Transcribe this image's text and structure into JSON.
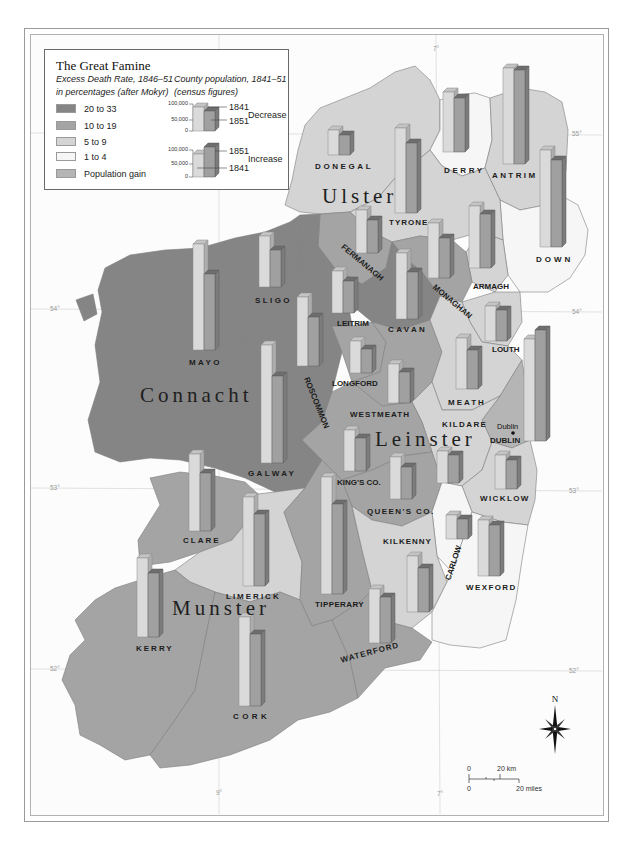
{
  "title": "The Great Famine",
  "legend": {
    "death_rate_heading": "Excess Death Rate, 1846–51",
    "death_rate_subheading": "in percentages (after Mokyr)",
    "population_heading": "County population, 1841–51",
    "population_subheading": "(census figures)",
    "categories": [
      {
        "id": "c20",
        "label": "20 to 33",
        "color": "#858585"
      },
      {
        "id": "c10",
        "label": "10 to 19",
        "color": "#a4a4a4"
      },
      {
        "id": "c5",
        "label": "5 to 9",
        "color": "#d4d4d4"
      },
      {
        "id": "c1",
        "label": "1 to 4",
        "color": "#f6f6f6"
      },
      {
        "id": "gain",
        "label": "Population gain",
        "color": "#b5b5b5"
      }
    ],
    "decrease_example": {
      "tick_100k": "100,000",
      "tick_50k": "50,000",
      "tick_0": "0",
      "label_upper": "1841",
      "label_lower": "1851",
      "trend": "Decrease"
    },
    "increase_example": {
      "tick_100k": "100,000",
      "tick_50k": "50,000",
      "tick_0": "0",
      "label_upper": "1851",
      "label_lower": "1841",
      "trend": "Increase"
    }
  },
  "bar_colors": {
    "y1841": {
      "front": "#dadada",
      "top": "#c4c4c4",
      "side": "#adadad",
      "stroke": "#8a8a8a"
    },
    "y1851": {
      "front": "#a0a0a0",
      "top": "#6e6e6e",
      "side": "#7c7c7c",
      "stroke": "#5e5e5e"
    }
  },
  "provinces": [
    {
      "name": "Ulster"
    },
    {
      "name": "Connacht"
    },
    {
      "name": "Leinster"
    },
    {
      "name": "Munster"
    }
  ],
  "graticule": {
    "lat55": "55°",
    "lat54": "54°",
    "lat53": "53°",
    "lat52": "52°",
    "lon7": "7°",
    "lon9": "9°"
  },
  "city": {
    "name": "Dublin"
  },
  "compass": {
    "north_label": "N"
  },
  "scale": {
    "km_zero": "0",
    "km_label": "20 km",
    "mi_zero": "0",
    "mi_label": "20 miles"
  },
  "counties": [
    {
      "id": "donegal",
      "name": "DONEGAL",
      "province": "Ulster",
      "category": "c5",
      "trend": "decrease",
      "bar_1841_px": 25,
      "bar_1851_px": 20,
      "pos": {
        "bar_x": 328,
        "bar_base": 155,
        "label_x": 315,
        "label_y": 167,
        "spacing": 2.6,
        "rot": 0
      }
    },
    {
      "id": "derry",
      "name": "DERRY",
      "province": "Ulster",
      "category": "c1",
      "trend": "decrease",
      "bar_1841_px": 60,
      "bar_1851_px": 54,
      "pos": {
        "bar_x": 443,
        "bar_base": 152,
        "label_x": 444,
        "label_y": 171,
        "spacing": 2.6,
        "rot": 0
      }
    },
    {
      "id": "antrim",
      "name": "ANTRIM",
      "province": "Ulster",
      "category": "c5",
      "trend": "decrease",
      "bar_1841_px": 96,
      "bar_1851_px": 94,
      "pos": {
        "bar_x": 503,
        "bar_base": 164,
        "label_x": 492,
        "label_y": 176,
        "spacing": 2.4,
        "rot": 0
      }
    },
    {
      "id": "tyrone",
      "name": "TYRONE",
      "province": "Ulster",
      "category": "c5",
      "trend": "decrease",
      "bar_1841_px": 85,
      "bar_1851_px": 70,
      "pos": {
        "bar_x": 395,
        "bar_base": 213,
        "label_x": 389,
        "label_y": 223,
        "spacing": 1,
        "rot": 0
      }
    },
    {
      "id": "down",
      "name": "DOWN",
      "province": "Ulster",
      "category": "c1",
      "trend": "decrease",
      "bar_1841_px": 97,
      "bar_1851_px": 87,
      "pos": {
        "bar_x": 540,
        "bar_base": 247,
        "label_x": 536,
        "label_y": 260,
        "spacing": 3,
        "rot": 0
      }
    },
    {
      "id": "fermanagh",
      "name": "FERMANAGH",
      "province": "Ulster",
      "category": "c10",
      "trend": "decrease",
      "bar_1841_px": 43,
      "bar_1851_px": 33,
      "pos": {
        "bar_x": 356,
        "bar_base": 253,
        "label_x": 362,
        "label_y": 263,
        "spacing": 0,
        "rot": 40
      }
    },
    {
      "id": "monaghan",
      "name": "MONAGHAN",
      "province": "Ulster",
      "category": "c10",
      "trend": "decrease",
      "bar_1841_px": 55,
      "bar_1851_px": 40,
      "pos": {
        "bar_x": 428,
        "bar_base": 278,
        "label_x": 452,
        "label_y": 302,
        "spacing": 0,
        "rot": 40
      }
    },
    {
      "id": "armagh",
      "name": "ARMAGH",
      "province": "Ulster",
      "category": "c5",
      "trend": "decrease",
      "bar_1841_px": 62,
      "bar_1851_px": 54,
      "pos": {
        "bar_x": 469,
        "bar_base": 268,
        "label_x": 473,
        "label_y": 287,
        "spacing": 0,
        "rot": 0
      }
    },
    {
      "id": "cavan",
      "name": "CAVAN",
      "province": "Ulster",
      "category": "c20",
      "trend": "decrease",
      "bar_1841_px": 66,
      "bar_1851_px": 47,
      "pos": {
        "bar_x": 396,
        "bar_base": 319,
        "label_x": 388,
        "label_y": 330,
        "spacing": 2.4,
        "rot": 0
      }
    },
    {
      "id": "leitrim",
      "name": "LEITRIM",
      "province": "Connacht",
      "category": "c20",
      "trend": "decrease",
      "bar_1841_px": 42,
      "bar_1851_px": 32,
      "pos": {
        "bar_x": 332,
        "bar_base": 313,
        "label_x": 337,
        "label_y": 324,
        "spacing": 0,
        "rot": 0
      }
    },
    {
      "id": "sligo",
      "name": "SLIGO",
      "province": "Connacht",
      "category": "c20",
      "trend": "decrease",
      "bar_1841_px": 51,
      "bar_1851_px": 37,
      "pos": {
        "bar_x": 259,
        "bar_base": 287,
        "label_x": 255,
        "label_y": 301,
        "spacing": 2.4,
        "rot": 0
      }
    },
    {
      "id": "mayo",
      "name": "MAYO",
      "province": "Connacht",
      "category": "c20",
      "trend": "decrease",
      "bar_1841_px": 106,
      "bar_1851_px": 76,
      "pos": {
        "bar_x": 193,
        "bar_base": 350,
        "label_x": 189,
        "label_y": 363,
        "spacing": 2.4,
        "rot": 0
      }
    },
    {
      "id": "roscommon",
      "name": "ROSCOMMON",
      "province": "Connacht",
      "category": "c20",
      "trend": "decrease",
      "bar_1841_px": 69,
      "bar_1851_px": 49,
      "pos": {
        "bar_x": 297,
        "bar_base": 366,
        "label_x": 316,
        "label_y": 403,
        "spacing": 0,
        "rot": 68
      }
    },
    {
      "id": "galway",
      "name": "GALWAY",
      "province": "Connacht",
      "category": "c20",
      "trend": "decrease",
      "bar_1841_px": 118,
      "bar_1851_px": 87,
      "pos": {
        "bar_x": 261,
        "bar_base": 463,
        "label_x": 248,
        "label_y": 474,
        "spacing": 2.4,
        "rot": 0
      }
    },
    {
      "id": "louth",
      "name": "LOUTH",
      "province": "Leinster",
      "category": "c5",
      "trend": "decrease",
      "bar_1841_px": 35,
      "bar_1851_px": 31,
      "pos": {
        "bar_x": 485,
        "bar_base": 341,
        "label_x": 492,
        "label_y": 350,
        "spacing": 0,
        "rot": 0
      }
    },
    {
      "id": "longford",
      "name": "LONGFORD",
      "province": "Leinster",
      "category": "c10",
      "trend": "decrease",
      "bar_1841_px": 32,
      "bar_1851_px": 24,
      "pos": {
        "bar_x": 350,
        "bar_base": 373,
        "label_x": 332,
        "label_y": 384,
        "spacing": 0,
        "rot": 0
      }
    },
    {
      "id": "westmeath",
      "name": "WESTMEATH",
      "province": "Leinster",
      "category": "c10",
      "trend": "decrease",
      "bar_1841_px": 39,
      "bar_1851_px": 31,
      "pos": {
        "bar_x": 388,
        "bar_base": 403,
        "label_x": 350,
        "label_y": 415,
        "spacing": 1,
        "rot": 0
      }
    },
    {
      "id": "meath",
      "name": "MEATH",
      "province": "Leinster",
      "category": "c5",
      "trend": "decrease",
      "bar_1841_px": 51,
      "bar_1851_px": 39,
      "pos": {
        "bar_x": 456,
        "bar_base": 389,
        "label_x": 448,
        "label_y": 403,
        "spacing": 2,
        "rot": 0
      }
    },
    {
      "id": "dublin",
      "name": "DUBLIN",
      "province": "Leinster",
      "category": "gain",
      "trend": "increase",
      "bar_1841_px": 102,
      "bar_1851_px": 111,
      "pos": {
        "bar_x": 524,
        "bar_base": 441,
        "label_x": 490,
        "label_y": 441,
        "spacing": 0,
        "rot": 0
      }
    },
    {
      "id": "kings",
      "name": "KING'S CO.",
      "province": "Leinster",
      "category": "c10",
      "trend": "decrease",
      "bar_1841_px": 41,
      "bar_1851_px": 33,
      "pos": {
        "bar_x": 344,
        "bar_base": 471,
        "label_x": 337,
        "label_y": 483,
        "spacing": 0,
        "rot": 0
      }
    },
    {
      "id": "queens",
      "name": "QUEEN'S CO.",
      "province": "Leinster",
      "category": "c10",
      "trend": "decrease",
      "bar_1841_px": 42,
      "bar_1851_px": 32,
      "pos": {
        "bar_x": 390,
        "bar_base": 499,
        "label_x": 367,
        "label_y": 512,
        "spacing": 1.4,
        "rot": 0
      }
    },
    {
      "id": "kildare",
      "name": "KILDARE",
      "province": "Leinster",
      "category": "c5",
      "trend": "decrease",
      "bar_1841_px": 32,
      "bar_1851_px": 28,
      "pos": {
        "bar_x": 437,
        "bar_base": 483,
        "label_x": 442,
        "label_y": 425,
        "spacing": 1.4,
        "rot": 0
      }
    },
    {
      "id": "wicklow",
      "name": "WICKLOW",
      "province": "Leinster",
      "category": "c5",
      "trend": "decrease",
      "bar_1841_px": 34,
      "bar_1851_px": 29,
      "pos": {
        "bar_x": 495,
        "bar_base": 489,
        "label_x": 480,
        "label_y": 499,
        "spacing": 1.4,
        "rot": 0
      }
    },
    {
      "id": "carlow",
      "name": "CARLOW",
      "province": "Leinster",
      "category": "c1",
      "trend": "decrease",
      "bar_1841_px": 24,
      "bar_1851_px": 20,
      "pos": {
        "bar_x": 446,
        "bar_base": 539,
        "label_x": 454,
        "label_y": 563,
        "spacing": 0,
        "rot": -72
      }
    },
    {
      "id": "wexford",
      "name": "WEXFORD",
      "province": "Leinster",
      "category": "c1",
      "trend": "decrease",
      "bar_1841_px": 56,
      "bar_1851_px": 51,
      "pos": {
        "bar_x": 478,
        "bar_base": 576,
        "label_x": 466,
        "label_y": 588,
        "spacing": 1.4,
        "rot": 0
      }
    },
    {
      "id": "kilkenny",
      "name": "KILKENNY",
      "province": "Leinster",
      "category": "c5",
      "trend": "decrease",
      "bar_1841_px": 56,
      "bar_1851_px": 44,
      "pos": {
        "bar_x": 407,
        "bar_base": 612,
        "label_x": 383,
        "label_y": 542,
        "spacing": 1,
        "rot": 0
      }
    },
    {
      "id": "waterford",
      "name": "WATERFORD",
      "province": "Munster",
      "category": "c10",
      "trend": "decrease",
      "bar_1841_px": 54,
      "bar_1851_px": 46,
      "pos": {
        "bar_x": 369,
        "bar_base": 643,
        "label_x": 370,
        "label_y": 653,
        "spacing": 1,
        "rot": -15
      }
    },
    {
      "id": "tipperary",
      "name": "TIPPERARY",
      "province": "Munster",
      "category": "c10",
      "trend": "decrease",
      "bar_1841_px": 117,
      "bar_1851_px": 90,
      "pos": {
        "bar_x": 321,
        "bar_base": 594,
        "label_x": 315,
        "label_y": 605,
        "spacing": 0.4,
        "rot": 0
      }
    },
    {
      "id": "limerick",
      "name": "LIMERICK",
      "province": "Munster",
      "category": "c5",
      "trend": "decrease",
      "bar_1841_px": 89,
      "bar_1851_px": 72,
      "pos": {
        "bar_x": 243,
        "bar_base": 586,
        "label_x": 226,
        "label_y": 597,
        "spacing": 2,
        "rot": 0
      }
    },
    {
      "id": "clare",
      "name": "CLARE",
      "province": "Munster",
      "category": "c10",
      "trend": "decrease",
      "bar_1841_px": 77,
      "bar_1851_px": 58,
      "pos": {
        "bar_x": 189,
        "bar_base": 531,
        "label_x": 183,
        "label_y": 541,
        "spacing": 2,
        "rot": 0
      }
    },
    {
      "id": "kerry",
      "name": "KERRY",
      "province": "Munster",
      "category": "c10",
      "trend": "decrease",
      "bar_1841_px": 79,
      "bar_1851_px": 64,
      "pos": {
        "bar_x": 137,
        "bar_base": 637,
        "label_x": 136,
        "label_y": 649,
        "spacing": 2,
        "rot": 0
      }
    },
    {
      "id": "cork",
      "name": "CORK",
      "province": "Munster",
      "category": "c10",
      "trend": "decrease",
      "bar_1841_px": 89,
      "bar_1851_px": 72,
      "pos": {
        "bar_x": 239,
        "bar_base": 706,
        "label_x": 233,
        "label_y": 717,
        "spacing": 3.4,
        "rot": 0
      }
    }
  ]
}
